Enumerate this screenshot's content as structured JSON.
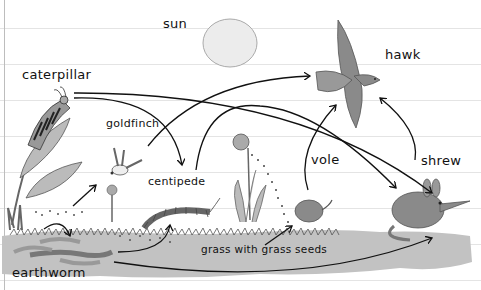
{
  "diagram": {
    "type": "food-web",
    "colors": {
      "ink": "#111111",
      "ground": "#b8b8b8",
      "animal": "#8a8a8a",
      "sun": "#e8e8e8",
      "rule": "#e4e4e4"
    },
    "labels": {
      "sun": "sun",
      "hawk": "hawk",
      "caterpillar": "caterpillar",
      "goldfinch": "goldfinch",
      "centipede": "centipede",
      "vole": "vole",
      "shrew": "shrew",
      "grass": "grass with grass seeds",
      "earthworm": "earthworm"
    },
    "arrows": [
      {
        "from": "caterpillar",
        "to": "centipede"
      },
      {
        "from": "caterpillar",
        "to": "shrew"
      },
      {
        "from": "goldfinch",
        "to": "hawk"
      },
      {
        "from": "centipede",
        "to": "shrew"
      },
      {
        "from": "vole",
        "to": "hawk"
      },
      {
        "from": "shrew",
        "to": "hawk"
      },
      {
        "from": "grass with grass seeds",
        "to": "goldfinch"
      },
      {
        "from": "grass with grass seeds",
        "to": "vole"
      },
      {
        "from": "earthworm",
        "to": "centipede"
      },
      {
        "from": "earthworm",
        "to": "shrew"
      },
      {
        "from": "earthworm",
        "to": "earthworm-detritus"
      }
    ]
  }
}
